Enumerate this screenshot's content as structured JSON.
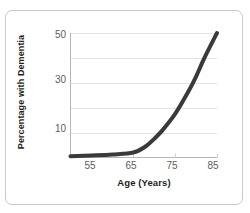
{
  "chart_data": {
    "type": "line",
    "title": "",
    "xlabel": "Age (Years)",
    "ylabel": "Percentage with Dementia",
    "xlim": [
      50,
      85
    ],
    "ylim": [
      0,
      50
    ],
    "xticks": [
      "55",
      "65",
      "75",
      "85"
    ],
    "xtick_values": [
      55,
      65,
      75,
      85
    ],
    "yticks": [
      "10",
      "30",
      "50"
    ],
    "ytick_values": [
      10,
      30,
      50
    ],
    "gridlines": {
      "y": [
        10,
        20,
        30,
        40,
        50
      ],
      "x": false,
      "color": "#e3e3e3"
    },
    "legend": null,
    "series": [
      {
        "name": "Percentage with Dementia",
        "color": "#3a3a3a",
        "line_width": 4,
        "x": [
          50,
          55,
          60,
          65,
          68,
          70,
          72,
          75,
          78,
          80,
          82,
          85
        ],
        "values": [
          0.5,
          0.8,
          1.2,
          2.0,
          4.5,
          7.5,
          11.0,
          17.5,
          26.0,
          32.5,
          40.0,
          50.0
        ]
      }
    ]
  },
  "figure": {
    "border_color": "#c9c9c9",
    "background": "#ffffff",
    "axis_color": "#b5b5b5",
    "tick_label_color": "#5c5c5c",
    "axis_title_color": "#231f20"
  }
}
